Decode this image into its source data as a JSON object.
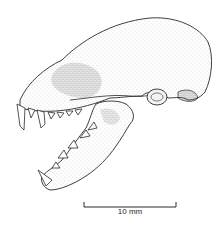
{
  "figure": {
    "colors": {
      "ink": "#2a2a2a",
      "background": "#ffffff"
    }
  },
  "scale_bar": {
    "label": "10 mm"
  }
}
